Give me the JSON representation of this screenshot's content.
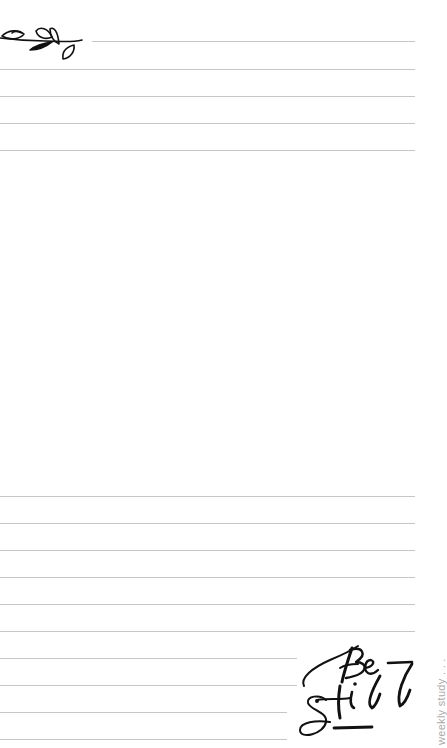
{
  "page": {
    "background": "#ffffff",
    "rule_color": "#c6c6c6",
    "ink_color": "#111111"
  },
  "decorations": {
    "sprig": "olive-branch-sprig",
    "lettering_text": "Be Still"
  },
  "side_label": {
    "text": "weekly study . . .",
    "color": "#a9a9a9"
  },
  "top_rules": [
    {
      "y": 41,
      "x1": 92,
      "x2": 415
    },
    {
      "y": 69,
      "x1": 0,
      "x2": 415
    },
    {
      "y": 96,
      "x1": 0,
      "x2": 415
    },
    {
      "y": 123,
      "x1": 0,
      "x2": 415
    },
    {
      "y": 150,
      "x1": 0,
      "x2": 415
    }
  ],
  "bottom_rules": [
    {
      "y": 496,
      "x1": 0,
      "x2": 415
    },
    {
      "y": 523,
      "x1": 0,
      "x2": 415
    },
    {
      "y": 550,
      "x1": 0,
      "x2": 415
    },
    {
      "y": 577,
      "x1": 0,
      "x2": 415
    },
    {
      "y": 604,
      "x1": 0,
      "x2": 415
    },
    {
      "y": 631,
      "x1": 0,
      "x2": 415
    },
    {
      "y": 658,
      "x1": 0,
      "x2": 297
    },
    {
      "y": 685,
      "x1": 0,
      "x2": 297
    },
    {
      "y": 712,
      "x1": 0,
      "x2": 287
    },
    {
      "y": 739,
      "x1": 0,
      "x2": 287
    }
  ]
}
